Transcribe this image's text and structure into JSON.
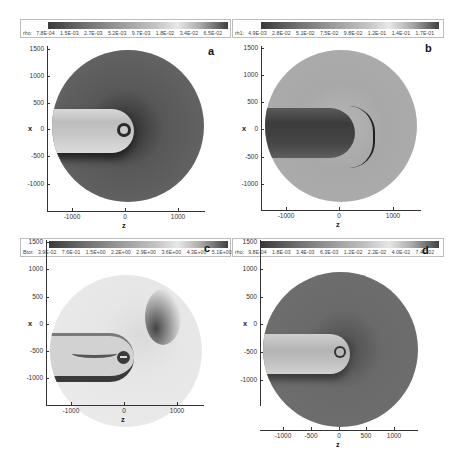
{
  "figure": {
    "panels": [
      {
        "id": "a",
        "letter": "a",
        "colorbar": {
          "variable": "rho:",
          "ticks": [
            "7.8E-04",
            "1.5E-03",
            "2.7E-03",
            "5.2E-03",
            "9.7E-03",
            "1.8E-02",
            "3.4E-02",
            "6.5E-02"
          ]
        },
        "x_axis": {
          "label": "z",
          "ticks": [
            "-1000",
            "0",
            "1000"
          ]
        },
        "y_axis": {
          "label": "x",
          "ticks": [
            "1500",
            "1000",
            "500",
            "0",
            "-500",
            "-1000"
          ]
        }
      },
      {
        "id": "b",
        "letter": "b",
        "colorbar": {
          "variable": "rh1:",
          "ticks": [
            "4.9E-03",
            "2.8E-02",
            "5.1E-02",
            "7.5E-02",
            "9.8E-02",
            "1.2E-01",
            "1.4E-01",
            "1.7E-01"
          ]
        },
        "x_axis": {
          "label": "z",
          "ticks": [
            "-1000",
            "0",
            "1000"
          ]
        },
        "y_axis": {
          "label": "x",
          "ticks": [
            "1500",
            "1000",
            "500",
            "0",
            "-500",
            "-1000"
          ]
        }
      },
      {
        "id": "c",
        "letter": "c",
        "colorbar": {
          "variable": "Btot:",
          "ticks": [
            "3.9E-02",
            "7.6E-01",
            "1.5E+00",
            "2.2E+00",
            "2.9E+00",
            "3.6E+00",
            "4.3E+00",
            "5.1E+00"
          ]
        },
        "x_axis": {
          "label": "z",
          "ticks": [
            "-1000",
            "0",
            "1000"
          ]
        },
        "y_axis": {
          "label": "x",
          "ticks": [
            "1500",
            "1000",
            "500",
            "0",
            "-500",
            "-1000"
          ]
        }
      },
      {
        "id": "d",
        "letter": "d",
        "colorbar": {
          "variable": "rho:",
          "ticks": [
            "9.8E-04",
            "1.8E-03",
            "3.4E-03",
            "6.3E-03",
            "1.2E-02",
            "2.2E-02",
            "4.0E-02",
            "7.4E-02"
          ]
        },
        "x_axis": {
          "label": "z",
          "ticks": [
            "-1000",
            "-500",
            "0",
            "500",
            "1000"
          ]
        },
        "y_axis": {
          "label": "x",
          "ticks": [
            "1500",
            "1000",
            "500",
            "0",
            "-500",
            "-1000"
          ]
        }
      }
    ]
  },
  "colors": {
    "disk_a": "#5a5a5a",
    "disk_b": "#a9a9a9",
    "disk_c": "#e4e4e4",
    "disk_d": "#6b6b6b",
    "axis": "#333333"
  }
}
